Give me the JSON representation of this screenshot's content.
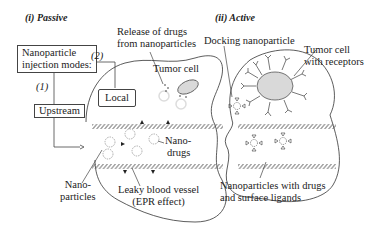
{
  "panels": {
    "passive": {
      "title": "(i) Passive",
      "injection_box": {
        "line1": "Nanoparticle",
        "line2": "injection modes:"
      },
      "mode_1": "(1)",
      "mode_2": "(2)",
      "upstream": "Upstream",
      "local": "Local",
      "release_label": {
        "line1": "Release of drugs",
        "line2": "from nanoparticles"
      },
      "tumor_cell": "Tumor cell",
      "nano_drugs": {
        "line1": "Nano-",
        "line2": "drugs"
      },
      "nanoparticles": {
        "line1": "Nano-",
        "line2": "particles"
      },
      "vessel": {
        "line1": "Leaky blood vessel",
        "line2": "(EPR effect)"
      }
    },
    "active": {
      "title": "(ii) Active",
      "docking": "Docking nanoparticle",
      "tumor_receptors": {
        "line1": "Tumor cell",
        "line2": "with receptors"
      },
      "ligands": {
        "line1": "Nanoparticles with drugs",
        "line2": "and surface ligands"
      }
    }
  },
  "colors": {
    "line": "#333333",
    "cell_fill": "#d9d9d9",
    "hatch": "#555555"
  }
}
